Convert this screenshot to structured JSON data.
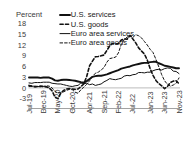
{
  "chart_data": {
    "type": "line",
    "title": "",
    "xlabel": "",
    "ylabel": "Percent",
    "unit_label": "Percent",
    "ylim": [
      -4.5,
      19.0
    ],
    "yticks": [
      18,
      15,
      12,
      9,
      6,
      3,
      0,
      -3
    ],
    "ytick_labels": [
      "18",
      "15",
      "12",
      "9",
      "6",
      "3",
      "0",
      "-3"
    ],
    "grid": false,
    "zero_line": true,
    "legend_position": "top-center",
    "x": [
      "Jul-19",
      "Aug-19",
      "Sep-19",
      "Oct-19",
      "Nov-19",
      "Dec-19",
      "Jan-20",
      "Feb-20",
      "Mar-20",
      "Apr-20",
      "May-20",
      "Jun-20",
      "Jul-20",
      "Aug-20",
      "Sep-20",
      "Oct-20",
      "Nov-20",
      "Dec-20",
      "Jan-21",
      "Feb-21",
      "Mar-21",
      "Apr-21",
      "May-21",
      "Jun-21",
      "Jul-21",
      "Aug-21",
      "Sep-21",
      "Oct-21",
      "Nov-21",
      "Dec-21",
      "Jan-22",
      "Feb-22",
      "Mar-22",
      "Apr-22",
      "May-22",
      "Jun-22",
      "Jul-22",
      "Aug-22",
      "Sep-22",
      "Oct-22",
      "Nov-22",
      "Dec-22",
      "Jan-23",
      "Feb-23",
      "Mar-23",
      "Apr-23",
      "May-23",
      "Jun-23",
      "Jul-23",
      "Aug-23",
      "Sep-23",
      "Oct-23",
      "Nov-23"
    ],
    "xtick_labels": [
      "Jul-19",
      "Dec-19",
      "May-20",
      "Oct-20",
      "Apr-21",
      "Sep-21",
      "Feb-22",
      "Jul-22",
      "Jan-23",
      "Jun-23",
      "Nov-23"
    ],
    "xtick_indices": [
      0,
      5,
      10,
      15,
      21,
      26,
      31,
      36,
      42,
      47,
      52
    ],
    "series": [
      {
        "name": "U.S. services",
        "style": "solid-thick",
        "color": "#111111",
        "values": [
          2.9,
          2.9,
          2.9,
          2.9,
          2.8,
          2.9,
          2.9,
          2.9,
          2.6,
          2.1,
          2.0,
          2.2,
          2.3,
          2.3,
          2.2,
          2.1,
          2.0,
          1.8,
          1.6,
          1.5,
          1.9,
          2.5,
          3.1,
          3.3,
          3.4,
          3.4,
          3.6,
          3.8,
          4.1,
          4.4,
          4.7,
          5.0,
          5.4,
          5.6,
          5.8,
          6.0,
          6.3,
          6.5,
          6.7,
          6.9,
          7.0,
          7.0,
          7.2,
          7.3,
          7.3,
          6.9,
          6.6,
          6.2,
          6.1,
          5.9,
          5.7,
          5.5,
          5.5
        ]
      },
      {
        "name": "U.S. goods",
        "style": "dashed-thick",
        "color": "#111111",
        "values": [
          0.7,
          0.5,
          0.3,
          0.4,
          0.5,
          0.4,
          0.3,
          0.0,
          -0.8,
          -2.6,
          -3.0,
          -1.5,
          -0.7,
          -0.3,
          -0.2,
          -0.3,
          -0.4,
          -0.3,
          0.4,
          1.1,
          3.2,
          6.2,
          7.5,
          8.7,
          8.8,
          9.0,
          9.2,
          10.5,
          11.8,
          12.5,
          12.3,
          12.4,
          13.4,
          13.7,
          13.6,
          14.7,
          13.7,
          12.6,
          11.2,
          10.3,
          9.5,
          7.8,
          5.4,
          3.5,
          2.1,
          1.2,
          0.6,
          -0.2,
          0.4,
          1.5,
          1.9,
          2.0,
          1.2
        ]
      },
      {
        "name": "Euro area services",
        "style": "solid-thin",
        "color": "#111111",
        "values": [
          1.4,
          1.3,
          1.5,
          1.5,
          1.5,
          1.6,
          1.6,
          1.6,
          1.3,
          1.2,
          1.1,
          1.1,
          0.9,
          0.7,
          0.5,
          0.4,
          0.6,
          0.7,
          1.4,
          1.2,
          1.3,
          0.9,
          1.1,
          0.7,
          0.9,
          1.1,
          1.7,
          2.1,
          2.6,
          2.4,
          2.3,
          2.5,
          2.7,
          3.3,
          3.5,
          3.4,
          3.7,
          3.8,
          4.3,
          4.3,
          4.2,
          4.4,
          4.4,
          4.8,
          5.1,
          5.2,
          5.0,
          5.4,
          5.6,
          5.5,
          4.7,
          4.6,
          4.0
        ]
      },
      {
        "name": "Euro area goods",
        "style": "dashed-thin",
        "color": "#111111",
        "values": [
          0.4,
          0.5,
          0.5,
          0.4,
          0.3,
          0.4,
          0.6,
          0.5,
          0.0,
          -1.0,
          -1.4,
          -1.3,
          -1.1,
          -0.7,
          -0.4,
          -0.5,
          -1.2,
          -1.5,
          -0.5,
          0.2,
          1.0,
          2.0,
          3.2,
          4.1,
          4.4,
          5.0,
          5.7,
          7.2,
          8.2,
          8.4,
          8.6,
          9.8,
          12.2,
          13.5,
          14.2,
          14.6,
          14.1,
          14.9,
          14.6,
          14.0,
          13.0,
          12.0,
          10.8,
          9.9,
          8.0,
          5.9,
          3.7,
          2.0,
          1.0,
          0.5,
          0.8,
          1.3,
          2.8
        ]
      }
    ]
  },
  "legend": {
    "items": [
      {
        "label": "U.S. services",
        "style": "solid-thick"
      },
      {
        "label": "U.S. goods",
        "style": "dashed-thick"
      },
      {
        "label": "Euro area services",
        "style": "solid-thin"
      },
      {
        "label": "Euro area goods",
        "style": "dashed-thin"
      }
    ]
  }
}
